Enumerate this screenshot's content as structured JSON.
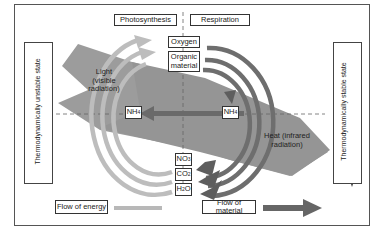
{
  "diagram": {
    "headers": {
      "left": "Photosynthesis",
      "right": "Respiration"
    },
    "side_labels": {
      "left": "Thermodynamically unstable state",
      "right": "Thermodynamically stable state"
    },
    "energy_labels": {
      "light_line1": "Light",
      "light_line2": "(visible",
      "light_line3": "radiation)",
      "heat_line1": "Heat (infrared",
      "heat_line2": "radiation)"
    },
    "compounds": {
      "oxygen": "Oxygen",
      "organic_line1": "Organic",
      "organic_line2": "material",
      "nh4_left": "NH",
      "nh4_left_sub": "4",
      "nh4_right": "NH",
      "nh4_right_sub": "4",
      "no3": "NO",
      "no3_sub": "3",
      "co2": "CO",
      "co2_sub": "2",
      "h2o_h": "H",
      "h2o_sub": "2",
      "h2o_o": "O"
    },
    "legend": {
      "energy": "Flow of energy",
      "material": "Flow of material"
    },
    "colors": {
      "energy_band": "#9a9a9a",
      "energy_arrow": "#b8b8b8",
      "material_arrow": "#6a6a6a",
      "frame": "#555555"
    }
  }
}
